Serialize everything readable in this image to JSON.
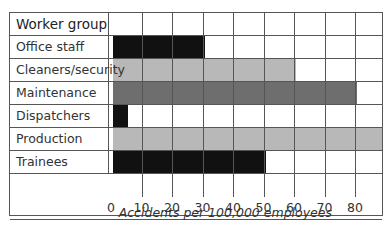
{
  "chart_data": {
    "type": "bar",
    "orientation": "horizontal",
    "title": "",
    "header_label": "Worker group",
    "categories": [
      "Office staff",
      "Cleaners/security",
      "Maintenance",
      "Dispatchers",
      "Production",
      "Trainees"
    ],
    "values": [
      30,
      60,
      80,
      5,
      90,
      50
    ],
    "colors": [
      "#111111",
      "#b8b8b8",
      "#6e6e6e",
      "#111111",
      "#b8b8b8",
      "#111111"
    ],
    "xlabel": "Accidents per 100,000 employees",
    "ylabel": "Worker group",
    "xticks": [
      0,
      10,
      20,
      30,
      40,
      50,
      60,
      70,
      80
    ],
    "xlim": [
      0,
      90
    ],
    "grid": true,
    "legend": "none"
  },
  "labels": {
    "header": "Worker group",
    "xlabel": "Accidents per 100,000 employees"
  }
}
